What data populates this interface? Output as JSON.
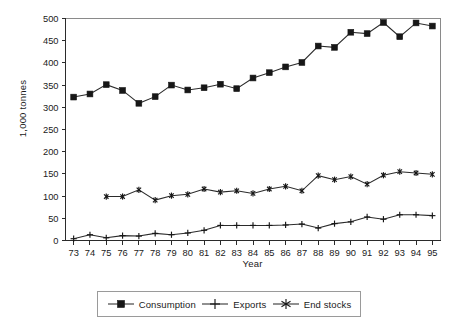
{
  "chart_data": {
    "type": "line",
    "title": "",
    "xlabel": "Year",
    "ylabel": "1,000 tonnes",
    "categories": [
      "73",
      "74",
      "75",
      "76",
      "77",
      "78",
      "79",
      "80",
      "81",
      "82",
      "83",
      "84",
      "85",
      "86",
      "87",
      "88",
      "89",
      "90",
      "91",
      "92",
      "93",
      "94",
      "95"
    ],
    "x_tick_labels": [
      "73",
      "74",
      "75",
      "76",
      "77",
      "78",
      "79",
      "80",
      "81",
      "82",
      "83",
      "84",
      "85",
      "86",
      "87",
      "88",
      "89",
      "90",
      "91",
      "92",
      "93",
      "94",
      "95"
    ],
    "y_tick_labels": [
      "0",
      "50",
      "100",
      "150",
      "200",
      "250",
      "300",
      "350",
      "400",
      "450",
      "500"
    ],
    "y_ticks": [
      0,
      50,
      100,
      150,
      200,
      250,
      300,
      350,
      400,
      450,
      500
    ],
    "ylim": [
      0,
      500
    ],
    "grid": false,
    "legend_position": "bottom",
    "series": [
      {
        "name": "Consumption",
        "marker": "filled-square",
        "color": "#171717",
        "values": [
          323,
          330,
          351,
          338,
          309,
          324,
          350,
          339,
          344,
          352,
          342,
          366,
          378,
          391,
          401,
          438,
          435,
          469,
          466,
          491,
          459,
          490,
          483
        ]
      },
      {
        "name": "Exports",
        "marker": "plus",
        "color": "#171717",
        "values": [
          4,
          13,
          6,
          11,
          10,
          16,
          13,
          17,
          23,
          34,
          34,
          34,
          34,
          35,
          37,
          28,
          38,
          42,
          53,
          48,
          58,
          58,
          56
        ]
      },
      {
        "name": "End stocks",
        "marker": "asterisk",
        "color": "#171717",
        "values": [
          null,
          null,
          99,
          99,
          114,
          91,
          101,
          104,
          116,
          109,
          112,
          106,
          116,
          122,
          112,
          146,
          137,
          144,
          127,
          147,
          155,
          152,
          149
        ]
      }
    ]
  },
  "axes": {
    "y_title": "1,000 tonnes",
    "x_title": "Year"
  },
  "legend": {
    "items": [
      {
        "label": "Consumption",
        "marker": "filled-square-marker"
      },
      {
        "label": "Exports",
        "marker": "plus-marker"
      },
      {
        "label": "End stocks",
        "marker": "asterisk-marker"
      }
    ]
  }
}
